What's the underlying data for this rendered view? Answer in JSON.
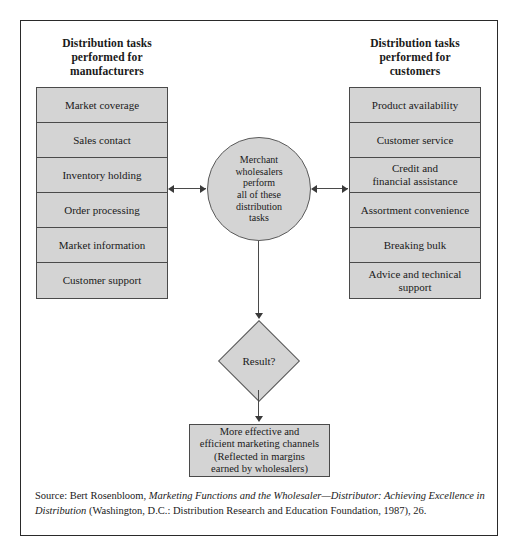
{
  "figure": {
    "headings": {
      "left": "Distribution tasks\nperformed for\nmanufacturers",
      "right": "Distribution tasks\nperformed for\ncustomers"
    },
    "left_tasks": [
      "Market coverage",
      "Sales contact",
      "Inventory holding",
      "Order processing",
      "Market information",
      "Customer support"
    ],
    "right_tasks": [
      "Product availability",
      "Customer service",
      "Credit and\nfinancial assistance",
      "Assortment convenience",
      "Breaking bulk",
      "Advice and technical\nsupport"
    ],
    "center_node": "Merchant\nwholesalers\nperform\nall of these\ndistribution\ntasks",
    "decision_node": "Result?",
    "outcome_node": "More effective and\nefficient marketing channels\n(Reflected in margins\nearned by wholesalers)",
    "colors": {
      "box_fill": "#d4d4d4",
      "box_border": "#4a4a4a",
      "frame_border": "#2a2a2a",
      "text": "#1a1a1a"
    }
  },
  "source": {
    "prefix": "Source: Bert Rosenbloom, ",
    "title_italic": "Marketing Functions and the Wholesaler—Distributor: Achieving Excellence in Distribution",
    "suffix": " (Washington, D.C.: Distribution Research and Education Foundation, 1987), 26."
  }
}
